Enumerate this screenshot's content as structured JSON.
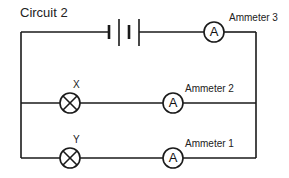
{
  "title": "Circuit 2",
  "components": {
    "battery": {
      "label": ""
    },
    "ammeter3": {
      "label": "Ammeter 3",
      "symbol": "A"
    },
    "ammeter2": {
      "label": "Ammeter 2",
      "symbol": "A"
    },
    "ammeter1": {
      "label": "Ammeter 1",
      "symbol": "A"
    },
    "lampX": {
      "label": "X"
    },
    "lampY": {
      "label": "Y"
    }
  },
  "colors": {
    "line": "#1a1a1a",
    "background": "#ffffff"
  }
}
